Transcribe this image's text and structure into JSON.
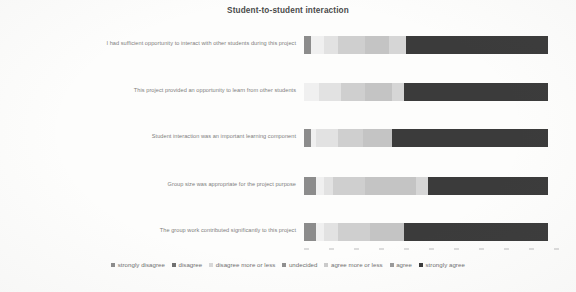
{
  "chart_data": {
    "type": "bar",
    "subtype": "stacked-horizontal-likert",
    "title": "Student-to-student interaction",
    "xlabel": "",
    "ylabel": "",
    "xlim": [
      0,
      100
    ],
    "grid": false,
    "legend_position": "bottom",
    "categories": [
      "I had sufficient opportunity to interact with other students during this project",
      "This project provided an opportunity to learn from other students",
      "Student interaction was an important learning component",
      "Group size was appropriate for the project purpose",
      "The group work contributed significantly to this project"
    ],
    "series": [
      {
        "name": "strongly disagree",
        "color": "#8c8c8c",
        "values": [
          3.0,
          0.0,
          3.0,
          5.0,
          5.0
        ]
      },
      {
        "name": "disagree",
        "color": "#f0f0f0",
        "values": [
          5.0,
          6.0,
          2.0,
          3.0,
          3.0
        ]
      },
      {
        "name": "disagree more or less",
        "color": "#e2e2e2",
        "values": [
          6.0,
          9.0,
          9.0,
          4.0,
          6.0
        ]
      },
      {
        "name": "undecided",
        "color": "#cfcfcf",
        "values": [
          11.0,
          10.0,
          10.0,
          13.0,
          13.0
        ]
      },
      {
        "name": "agree more or less",
        "color": "#c4c4c4",
        "values": [
          10.0,
          11.0,
          12.0,
          21.0,
          14.0
        ]
      },
      {
        "name": "agree",
        "color": "#d6d6d6",
        "values": [
          7.0,
          5.0,
          0.0,
          5.0,
          0.0
        ]
      },
      {
        "name": "strongly agree",
        "color": "#3b3b3b",
        "values": [
          58.0,
          59.0,
          64.0,
          49.0,
          59.0
        ]
      }
    ],
    "x_tick_count": 11
  },
  "legend": {
    "items": [
      {
        "label": "strongly disagree",
        "swatch": "legend-swatch-strongly-disagree",
        "color": "#8c8c8c"
      },
      {
        "label": "disagree",
        "swatch": "legend-swatch-disagree",
        "color": "#707070"
      },
      {
        "label": "disagree more or less",
        "swatch": "legend-swatch-disagree-more-or-less",
        "color": "#d8d8d8"
      },
      {
        "label": "undecided",
        "swatch": "legend-swatch-undecided",
        "color": "#8f8f8f"
      },
      {
        "label": "agree more or less",
        "swatch": "legend-swatch-agree-more-or-less",
        "color": "#cbcbcb"
      },
      {
        "label": "agree",
        "swatch": "legend-swatch-agree",
        "color": "#9a9a9a"
      },
      {
        "label": "strongly agree",
        "swatch": "legend-swatch-strongly-agree",
        "color": "#3b3b3b"
      }
    ]
  }
}
